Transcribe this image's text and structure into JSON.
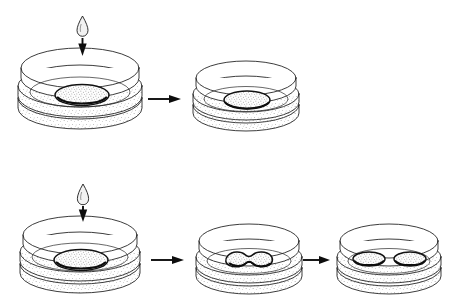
{
  "figure": {
    "title": "",
    "background_color": "#ffffff",
    "ink_color": "#1a1a1a",
    "width": 461,
    "height": 307,
    "style": "stippled line-art biological illustration"
  },
  "diagram": {
    "type": "process-sequence",
    "rows": [
      {
        "id": "row-top",
        "label": "",
        "steps": [
          {
            "id": "top-step-1",
            "icon": "droplet-with-down-arrow",
            "dish_label": "",
            "contents": "single-round-colony",
            "colony_count": 1
          },
          {
            "id": "top-step-2",
            "icon": "",
            "dish_label": "",
            "contents": "single-round-colony",
            "colony_count": 1
          }
        ],
        "arrows": 1
      },
      {
        "id": "row-bottom",
        "label": "",
        "steps": [
          {
            "id": "bottom-step-1",
            "icon": "droplet-with-down-arrow",
            "dish_label": "",
            "contents": "single-round-colony",
            "colony_count": 1
          },
          {
            "id": "bottom-step-2",
            "icon": "",
            "dish_label": "",
            "contents": "dumbbell-dividing-colony",
            "colony_count": 1
          },
          {
            "id": "bottom-step-3",
            "icon": "",
            "dish_label": "",
            "contents": "two-separated-colonies",
            "colony_count": 2
          }
        ],
        "arrows": 2
      }
    ],
    "legend": [],
    "annotations": []
  },
  "colors": {
    "ink": "#1a1a1a",
    "arrow": "#0d0d0d",
    "colony_fill": "#e8e8e8",
    "droplet_fill": "#f2f2f2",
    "background": "#ffffff"
  }
}
